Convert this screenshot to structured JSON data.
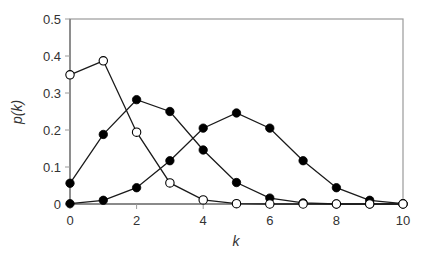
{
  "chart_data": {
    "type": "line",
    "title": "",
    "xlabel": "k",
    "ylabel": "p(k)",
    "xlim": [
      0,
      10
    ],
    "ylim": [
      0,
      0.5
    ],
    "x_ticks": [
      0,
      2,
      4,
      6,
      8,
      10
    ],
    "y_ticks": [
      0,
      0.1,
      0.2,
      0.3,
      0.4,
      0.5
    ],
    "y_tick_labels": [
      "0",
      "0.1",
      "0.2",
      "0.3",
      "0.4",
      "0.5"
    ],
    "x_tick_labels": [
      "0",
      "2",
      "4",
      "6",
      "8",
      "10"
    ],
    "grid": false,
    "legend": null,
    "x": [
      0,
      1,
      2,
      3,
      4,
      5,
      6,
      7,
      8,
      9,
      10
    ],
    "series": [
      {
        "name": "filled-peak-5",
        "marker": "filled-circle",
        "values": [
          0.001,
          0.01,
          0.044,
          0.117,
          0.205,
          0.246,
          0.205,
          0.117,
          0.044,
          0.01,
          0.001
        ]
      },
      {
        "name": "filled-peak-2",
        "marker": "filled-circle",
        "values": [
          0.056,
          0.188,
          0.282,
          0.25,
          0.146,
          0.058,
          0.016,
          0.003,
          0.0,
          0.0,
          0.0
        ]
      },
      {
        "name": "open-peak-1",
        "marker": "open-circle",
        "values": [
          0.349,
          0.387,
          0.194,
          0.057,
          0.011,
          0.001,
          0.0,
          0.0,
          0.0,
          0.0,
          0.0
        ]
      }
    ]
  },
  "colors": {
    "line": "#1a1a1a",
    "axis": "#9a9a9a",
    "marker_fill": "#000000",
    "open_marker_fill": "#ffffff",
    "text": "#333333"
  }
}
